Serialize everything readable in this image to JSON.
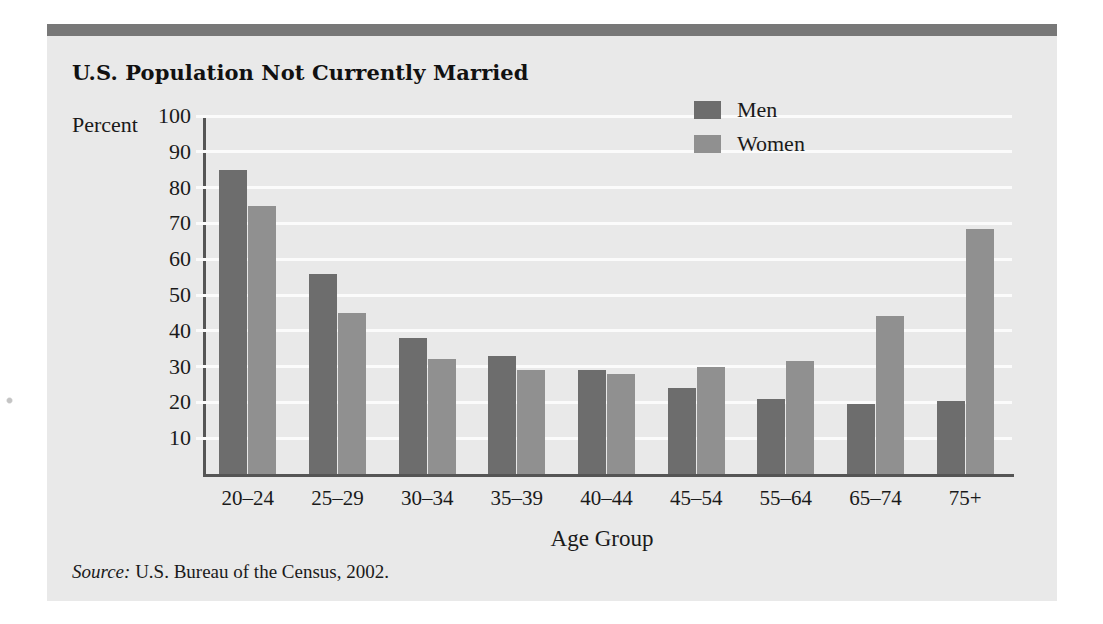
{
  "figure": {
    "title": "U.S. Population Not Currently Married",
    "source_keyword": "Source:",
    "source_text": " U.S. Bureau of the Census, 2002.",
    "accent_rule_color": "#787878",
    "panel_background": "#e9e9e9"
  },
  "legend": {
    "position": "top-right",
    "entries": [
      {
        "label": "Men",
        "color": "#6d6d6d"
      },
      {
        "label": "Women",
        "color": "#909090"
      }
    ]
  },
  "chart_data": {
    "type": "bar",
    "title": "U.S. Population Not Currently Married",
    "xlabel": "Age Group",
    "ylabel": "Percent",
    "ylim": [
      0,
      100
    ],
    "yticks": [
      0,
      10,
      20,
      30,
      40,
      50,
      60,
      70,
      80,
      90,
      100
    ],
    "ytick_labels": [
      "10",
      "20",
      "30",
      "40",
      "50",
      "60",
      "70",
      "80",
      "90",
      "100"
    ],
    "grid": true,
    "grid_color": "#fbfbfb",
    "legend_position": "upper right",
    "categories": [
      "20–24",
      "25–29",
      "30–34",
      "35–39",
      "40–44",
      "45–54",
      "55–64",
      "65–74",
      "75+"
    ],
    "series": [
      {
        "name": "Men",
        "color": "#6d6d6d",
        "values": [
          85,
          56,
          38,
          33,
          29,
          24,
          21,
          19.5,
          20.5
        ]
      },
      {
        "name": "Women",
        "color": "#909090",
        "values": [
          75,
          45,
          32,
          29,
          28,
          30,
          31.5,
          44,
          68.5
        ]
      }
    ]
  }
}
